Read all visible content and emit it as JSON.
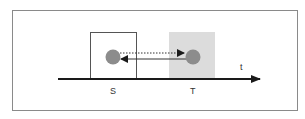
{
  "diagram": {
    "labels": {
      "source": "S",
      "target": "T",
      "time_axis": "t"
    },
    "colors": {
      "node": "#8c8c8c",
      "target_region": "#dcdcdc",
      "axis": "#1a1a1a",
      "frame": "#8a8a8a"
    },
    "arrows": [
      {
        "from": "S",
        "to": "T",
        "style": "dotted"
      },
      {
        "from": "T",
        "to": "S",
        "style": "solid"
      }
    ]
  }
}
